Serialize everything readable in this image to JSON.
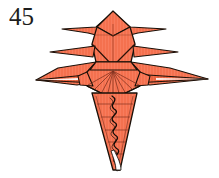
{
  "page": {
    "width": 219,
    "height": 178,
    "background": "#ffffff"
  },
  "step": {
    "number": "45",
    "label_name": "step-number"
  },
  "figure": {
    "colors": {
      "paper_fill": "#f4714f",
      "paper_fill_light": "#fa8568",
      "paper_fill_dark": "#e35c3c",
      "outline": "#1a1008",
      "crease": "#3a1c10",
      "white_paper": "#ffffff"
    },
    "parts": [
      {
        "name": "head-top-flap",
        "kind": "polygon"
      },
      {
        "name": "head-left-spike",
        "kind": "polygon"
      },
      {
        "name": "head-right-spike",
        "kind": "polygon"
      },
      {
        "name": "head-panel",
        "kind": "polygon"
      },
      {
        "name": "upper-left-wing-spike",
        "kind": "polygon"
      },
      {
        "name": "upper-right-wing-spike",
        "kind": "polygon"
      },
      {
        "name": "lower-left-wing-spike",
        "kind": "polygon"
      },
      {
        "name": "lower-right-wing-spike",
        "kind": "polygon"
      },
      {
        "name": "body-hexagon",
        "kind": "polygon"
      },
      {
        "name": "body-fan-creases",
        "kind": "lines"
      },
      {
        "name": "tail-triangle",
        "kind": "polygon"
      },
      {
        "name": "tail-crimp-zigzag",
        "kind": "path"
      },
      {
        "name": "tail-rung-creases",
        "kind": "lines"
      }
    ]
  }
}
